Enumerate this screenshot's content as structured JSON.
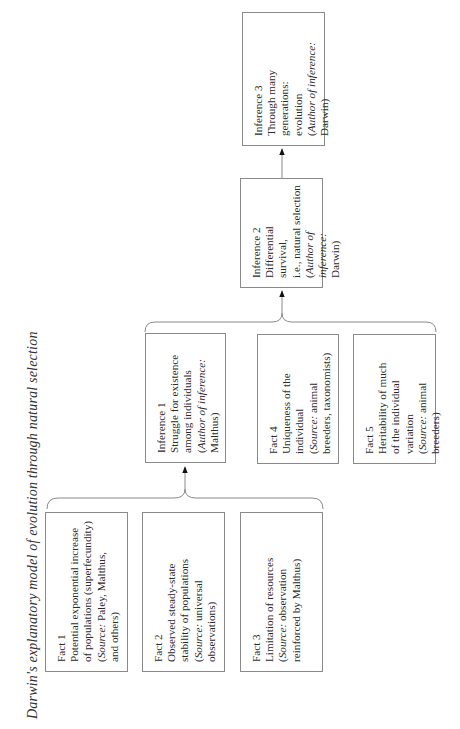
{
  "title": "Darwin's explanatory model of evolution through natural selection",
  "nodes": {
    "fact1": {
      "heading": "Fact 1",
      "body": "Potential exponential increase\nof populations (superfecundity)",
      "source_label": "Source:",
      "source_text": " Paley, Malthus,\nand others"
    },
    "fact2": {
      "heading": "Fact 2",
      "body": "Observed steady-state\nstability of populations",
      "source_label": "Source:",
      "source_text": " universal\nobservations"
    },
    "fact3": {
      "heading": "Fact 3",
      "body": "Limitation of resources",
      "source_label": "Source:",
      "source_text": " observation\nreinforced by Malthus"
    },
    "inference1": {
      "heading": "Inference 1",
      "body": "Struggle for existence\namong individuals",
      "source_label": "Author of inference:",
      "source_text": "\nMalthus"
    },
    "fact4": {
      "heading": "Fact 4",
      "body": "Uniqueness of the\nindividual",
      "source_label": "Source:",
      "source_text": " animal\nbreeders, taxonomists"
    },
    "fact5": {
      "heading": "Fact 5",
      "body": "Heritability of much\nof the individual\nvariation",
      "source_label": "Source:",
      "source_text": " animal breeders"
    },
    "inference2": {
      "heading": "Inference 2",
      "body": "Differential survival,\ni.e., natural selection",
      "source_label": "Author of inference:",
      "source_text": "\nDarwin"
    },
    "inference3": {
      "heading": "Inference 3",
      "body": "Through many generations:\nevolution",
      "source_label": "Author of inference:",
      "source_text": "\nDarwin"
    }
  },
  "edges": [
    {
      "from": [
        "fact1",
        "fact2",
        "fact3"
      ],
      "to": "inference1",
      "type": "bracket-arrow"
    },
    {
      "from": [
        "inference1",
        "fact4",
        "fact5"
      ],
      "to": "inference2",
      "type": "bracket-arrow"
    },
    {
      "from": [
        "inference2"
      ],
      "to": "inference3",
      "type": "arrow"
    }
  ],
  "colors": {
    "box_border": "#8a8a8a",
    "line": "#8a8a8a",
    "arrowhead": "#111111",
    "text": "#2a2a2a"
  }
}
